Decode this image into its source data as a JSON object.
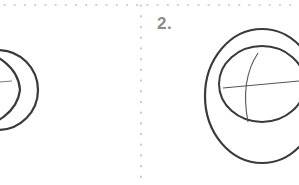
{
  "diagram": {
    "panels": [
      {
        "label": "1.",
        "visible_label": false,
        "content": "circle-with-horizontal-line"
      },
      {
        "label": "2.",
        "visible_label": true,
        "content": "outer-circle-with-inner-circle-and-cross-lines"
      }
    ],
    "colors": {
      "background": "#ffffff",
      "stroke": "#3a3a3a",
      "thin_stroke": "#6a6a6a",
      "divider_dots": "#a8a8a8",
      "label": "#8a8a8a"
    }
  }
}
